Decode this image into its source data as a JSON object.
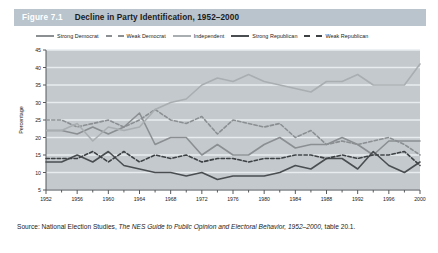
{
  "figure": {
    "number": "Figure 7.1",
    "title": "Decline in Party Identification, 1952–2000",
    "source_prefix": "Source:",
    "source_text": "National Election Studies,",
    "source_italic": "The NES Guide to Public Opinion and Electoral Behavior, 1952–2000,",
    "source_line2": "table 20.1."
  },
  "colors": {
    "title_bar": "#b9c4cc",
    "plot_background": "#c3c9cd",
    "gridline": "#e8ecef",
    "strong_democrat": "#8b8f92",
    "weak_democrat": "#8b8f92",
    "independent": "#a9aeb1",
    "strong_republican": "#4a4e51",
    "weak_republican": "#3d4144",
    "axis": "#55595c",
    "text": "#1b1b1b"
  },
  "chart_data": {
    "type": "line",
    "title": "Decline in Party Identification, 1952–2000",
    "xlabel": "",
    "ylabel": "Percentage",
    "ylim": [
      5,
      45
    ],
    "ytick_step": 5,
    "yticks": [
      5,
      10,
      15,
      20,
      25,
      30,
      35,
      40,
      45
    ],
    "grid": true,
    "legend_position": "top",
    "x": [
      1952,
      1954,
      1956,
      1958,
      1960,
      1962,
      1964,
      1966,
      1968,
      1970,
      1972,
      1974,
      1976,
      1978,
      1980,
      1982,
      1984,
      1986,
      1988,
      1990,
      1992,
      1994,
      1996,
      1998,
      2000
    ],
    "xtick_labels": [
      "1952",
      "1956",
      "1960",
      "1964",
      "1968",
      "1972",
      "1976",
      "1980",
      "1984",
      "1988",
      "1992",
      "1996",
      "2000"
    ],
    "xtick_values": [
      1952,
      1956,
      1960,
      1964,
      1968,
      1972,
      1976,
      1980,
      1984,
      1988,
      1992,
      1996,
      2000
    ],
    "series": [
      {
        "name": "Strong Democrat",
        "style": "solid",
        "color": "#8b8f92",
        "width": 1.6,
        "values": [
          22,
          22,
          21,
          23,
          21,
          23,
          27,
          18,
          20,
          20,
          15,
          18,
          15,
          15,
          18,
          20,
          17,
          18,
          18,
          20,
          18,
          15,
          19,
          19,
          19
        ]
      },
      {
        "name": "Weak Democrat",
        "style": "dashed",
        "color": "#8b8f92",
        "width": 1.6,
        "values": [
          25,
          25,
          23,
          24,
          25,
          23,
          25,
          28,
          25,
          24,
          26,
          21,
          25,
          24,
          23,
          24,
          20,
          22,
          18,
          19,
          18,
          19,
          20,
          18,
          15
        ]
      },
      {
        "name": "Independent",
        "style": "solid",
        "color": "#a9aeb1",
        "width": 1.6,
        "values": [
          22,
          22,
          24,
          19,
          23,
          22,
          23,
          28,
          30,
          31,
          35,
          37,
          36,
          38,
          36,
          35,
          34,
          33,
          36,
          36,
          38,
          35,
          35,
          35,
          41
        ]
      },
      {
        "name": "Strong Republican",
        "style": "solid",
        "color": "#4a4e51",
        "width": 1.6,
        "values": [
          13,
          13,
          15,
          13,
          16,
          12,
          11,
          10,
          10,
          9,
          10,
          8,
          9,
          9,
          9,
          10,
          12,
          11,
          14,
          14,
          11,
          16,
          12,
          10,
          13
        ]
      },
      {
        "name": "Weak Republican",
        "style": "dashed",
        "color": "#3d4144",
        "width": 1.6,
        "values": [
          14,
          14,
          14,
          16,
          13,
          16,
          13,
          15,
          14,
          15,
          13,
          14,
          14,
          13,
          14,
          14,
          15,
          15,
          14,
          15,
          14,
          15,
          15,
          16,
          12
        ]
      }
    ]
  }
}
